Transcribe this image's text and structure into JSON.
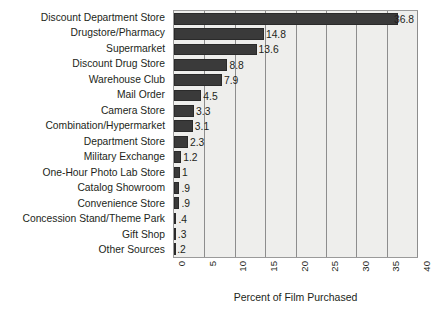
{
  "chart_data": {
    "type": "bar",
    "orientation": "horizontal",
    "title": "",
    "xlabel": "Percent of Film Purchased",
    "ylabel": "",
    "xlim": [
      0,
      40
    ],
    "xticks": [
      "0",
      "5",
      "10",
      "15",
      "20",
      "25",
      "30",
      "35",
      "40"
    ],
    "grid": "vertical",
    "legend": "none",
    "categories": [
      "Discount Department Store",
      "Drugstore/Pharmacy",
      "Supermarket",
      "Discount Drug Store",
      "Warehouse Club",
      "Mail Order",
      "Camera Store",
      "Combination/Hypermarket",
      "Department Store",
      "Military Exchange",
      "One-Hour Photo Lab Store",
      "Catalog Showroom",
      "Convenience Store",
      "Concession Stand/Theme Park",
      "Gift Shop",
      "Other Sources"
    ],
    "values": [
      36.8,
      14.8,
      13.6,
      8.8,
      7.9,
      4.5,
      3.3,
      3.1,
      2.3,
      1.2,
      1,
      0.9,
      0.9,
      0.4,
      0.3,
      0.2
    ],
    "value_labels": [
      "36.8",
      "14.8",
      "13.6",
      "8.8",
      "7.9",
      "4.5",
      "3.3",
      "3.1",
      "2.3",
      "1.2",
      "1",
      ".9",
      ".9",
      ".4",
      ".3",
      ".2"
    ],
    "colors": {
      "bar": "#3a3a3a",
      "plot_background": "#eeeeec",
      "gridline": "#8d8d8d",
      "border": "#9a9a9a",
      "text": "#231f20",
      "page_background": "#ffffff"
    }
  }
}
